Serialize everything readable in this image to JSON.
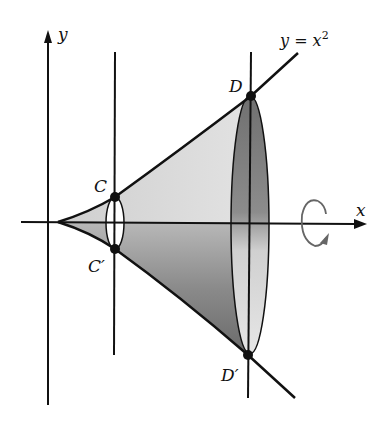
{
  "diagram": {
    "type": "solid-of-revolution",
    "curve_label": "y = x",
    "curve_exponent": "2",
    "axis_labels": {
      "x": "x",
      "y": "y"
    },
    "points": [
      {
        "name": "C",
        "label": "C"
      },
      {
        "name": "C-prime",
        "label": "C′"
      },
      {
        "name": "D",
        "label": "D"
      },
      {
        "name": "D-prime",
        "label": "D′"
      }
    ],
    "rotation_indicator": "rotation about x-axis",
    "colors": {
      "line": "#111111",
      "shade_light": "#d9d9d9",
      "shade_dark": "#7a7a7a",
      "arrow": "#666666"
    }
  }
}
